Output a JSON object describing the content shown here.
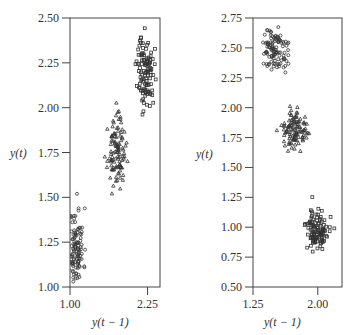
{
  "chart_data": [
    {
      "type": "scatter",
      "title": "",
      "xlabel": "y(t − 1)",
      "ylabel": "y(t)",
      "xlim": [
        1.0,
        2.45
      ],
      "ylim": [
        1.0,
        2.5
      ],
      "x_ticks": [
        "1.00",
        "2.25"
      ],
      "x_tick_values": [
        1.0,
        2.25
      ],
      "y_ticks": [
        "1.00",
        "1.25",
        "1.50",
        "1.75",
        "2.00",
        "2.25",
        "2.50"
      ],
      "y_tick_values": [
        1.0,
        1.25,
        1.5,
        1.75,
        2.0,
        2.25,
        2.5
      ],
      "grid": false,
      "legend": null,
      "series": [
        {
          "name": "regime-1",
          "marker": "circle",
          "cx": 1.1,
          "cy": 1.22,
          "sx": 0.06,
          "sy": 0.11,
          "n": 110,
          "seed": 11
        },
        {
          "name": "regime-2",
          "marker": "triangle",
          "cx": 1.75,
          "cy": 1.75,
          "sx": 0.07,
          "sy": 0.09,
          "n": 110,
          "seed": 23
        },
        {
          "name": "regime-3",
          "marker": "square",
          "cx": 2.22,
          "cy": 2.2,
          "sx": 0.07,
          "sy": 0.1,
          "n": 110,
          "seed": 37
        }
      ]
    },
    {
      "type": "scatter",
      "title": "",
      "xlabel": "y(t − 1)",
      "ylabel": "y(t)",
      "xlim": [
        1.25,
        2.28
      ],
      "ylim": [
        0.5,
        2.75
      ],
      "x_ticks": [
        "1.25",
        "2.00"
      ],
      "x_tick_values": [
        1.25,
        2.0
      ],
      "y_ticks": [
        "0.50",
        "0.75",
        "1.00",
        "1.25",
        "1.50",
        "1.75",
        "2.00",
        "2.25",
        "2.50",
        "2.75"
      ],
      "y_tick_values": [
        0.5,
        0.75,
        1.0,
        1.25,
        1.5,
        1.75,
        2.0,
        2.25,
        2.5,
        2.75
      ],
      "grid": false,
      "legend": null,
      "series": [
        {
          "name": "regime-1",
          "marker": "circle",
          "cx": 1.5,
          "cy": 2.48,
          "sx": 0.08,
          "sy": 0.09,
          "n": 110,
          "seed": 51
        },
        {
          "name": "regime-2",
          "marker": "triangle",
          "cx": 1.73,
          "cy": 1.8,
          "sx": 0.07,
          "sy": 0.08,
          "n": 110,
          "seed": 67
        },
        {
          "name": "regime-3",
          "marker": "square",
          "cx": 2.0,
          "cy": 0.98,
          "sx": 0.07,
          "sy": 0.09,
          "n": 110,
          "seed": 89
        }
      ]
    }
  ],
  "panels": [
    {
      "frame": {
        "x": 70,
        "y": 18,
        "w": 90,
        "h": 269
      }
    },
    {
      "frame": {
        "x": 253,
        "y": 18,
        "w": 89,
        "h": 269
      }
    }
  ],
  "labels": {
    "left_ylabel": "y(t)",
    "left_xlabel": "y(t − 1)",
    "right_ylabel": "y(t)",
    "right_xlabel": "y(t − 1)"
  }
}
